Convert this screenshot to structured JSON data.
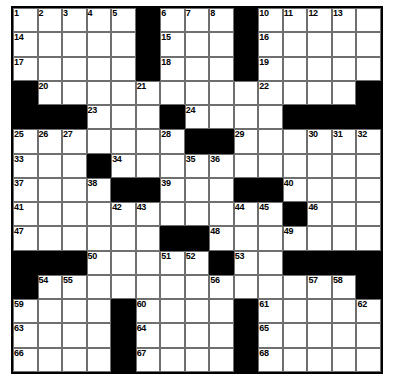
{
  "puzzle": {
    "type": "crossword-grid",
    "rows": 15,
    "cols": 15,
    "background_color": "#ffffff",
    "block_color": "#000000",
    "cell_color": "#ffffff",
    "grid_line_color": "#6f6f6f",
    "border_color": "#000000",
    "number_color": "#000000",
    "max_number": 68,
    "blocks": [
      [
        0,
        5
      ],
      [
        0,
        9
      ],
      [
        1,
        5
      ],
      [
        1,
        9
      ],
      [
        2,
        5
      ],
      [
        2,
        9
      ],
      [
        3,
        0
      ],
      [
        3,
        14
      ],
      [
        4,
        0
      ],
      [
        4,
        1
      ],
      [
        4,
        2
      ],
      [
        4,
        6
      ],
      [
        4,
        11
      ],
      [
        4,
        12
      ],
      [
        4,
        13
      ],
      [
        4,
        14
      ],
      [
        5,
        7
      ],
      [
        5,
        8
      ],
      [
        6,
        3
      ],
      [
        7,
        4
      ],
      [
        7,
        5
      ],
      [
        7,
        9
      ],
      [
        7,
        10
      ],
      [
        8,
        11
      ],
      [
        9,
        6
      ],
      [
        9,
        7
      ],
      [
        10,
        0
      ],
      [
        10,
        1
      ],
      [
        10,
        2
      ],
      [
        10,
        8
      ],
      [
        10,
        11
      ],
      [
        10,
        12
      ],
      [
        10,
        13
      ],
      [
        10,
        14
      ],
      [
        11,
        0
      ],
      [
        11,
        14
      ],
      [
        12,
        4
      ],
      [
        12,
        9
      ],
      [
        13,
        4
      ],
      [
        13,
        9
      ],
      [
        14,
        4
      ],
      [
        14,
        9
      ]
    ],
    "numbers": [
      {
        "row": 0,
        "col": 0,
        "n": 1
      },
      {
        "row": 0,
        "col": 1,
        "n": 2
      },
      {
        "row": 0,
        "col": 2,
        "n": 3
      },
      {
        "row": 0,
        "col": 3,
        "n": 4
      },
      {
        "row": 0,
        "col": 4,
        "n": 5
      },
      {
        "row": 0,
        "col": 6,
        "n": 6
      },
      {
        "row": 0,
        "col": 7,
        "n": 7
      },
      {
        "row": 0,
        "col": 8,
        "n": 8
      },
      {
        "row": 0,
        "col": 9,
        "n": 9
      },
      {
        "row": 0,
        "col": 10,
        "n": 10
      },
      {
        "row": 0,
        "col": 11,
        "n": 11
      },
      {
        "row": 0,
        "col": 12,
        "n": 12
      },
      {
        "row": 0,
        "col": 13,
        "n": 13
      },
      {
        "row": 1,
        "col": 0,
        "n": 14
      },
      {
        "row": 1,
        "col": 6,
        "n": 15
      },
      {
        "row": 1,
        "col": 10,
        "n": 16
      },
      {
        "row": 2,
        "col": 0,
        "n": 17
      },
      {
        "row": 2,
        "col": 6,
        "n": 18
      },
      {
        "row": 2,
        "col": 10,
        "n": 19
      },
      {
        "row": 3,
        "col": 1,
        "n": 20
      },
      {
        "row": 3,
        "col": 5,
        "n": 21
      },
      {
        "row": 3,
        "col": 10,
        "n": 22
      },
      {
        "row": 4,
        "col": 3,
        "n": 23
      },
      {
        "row": 4,
        "col": 7,
        "n": 24
      },
      {
        "row": 5,
        "col": 0,
        "n": 25
      },
      {
        "row": 5,
        "col": 1,
        "n": 26
      },
      {
        "row": 5,
        "col": 2,
        "n": 27
      },
      {
        "row": 5,
        "col": 6,
        "n": 28
      },
      {
        "row": 5,
        "col": 9,
        "n": 29
      },
      {
        "row": 5,
        "col": 12,
        "n": 30
      },
      {
        "row": 5,
        "col": 13,
        "n": 31
      },
      {
        "row": 5,
        "col": 14,
        "n": 32
      },
      {
        "row": 6,
        "col": 0,
        "n": 33
      },
      {
        "row": 6,
        "col": 4,
        "n": 34
      },
      {
        "row": 6,
        "col": 7,
        "n": 35
      },
      {
        "row": 6,
        "col": 8,
        "n": 36
      },
      {
        "row": 7,
        "col": 0,
        "n": 37
      },
      {
        "row": 7,
        "col": 3,
        "n": 38
      },
      {
        "row": 7,
        "col": 6,
        "n": 39
      },
      {
        "row": 7,
        "col": 11,
        "n": 40
      },
      {
        "row": 8,
        "col": 0,
        "n": 41
      },
      {
        "row": 8,
        "col": 4,
        "n": 42
      },
      {
        "row": 8,
        "col": 5,
        "n": 43
      },
      {
        "row": 8,
        "col": 9,
        "n": 44
      },
      {
        "row": 8,
        "col": 10,
        "n": 45
      },
      {
        "row": 8,
        "col": 12,
        "n": 46
      },
      {
        "row": 9,
        "col": 0,
        "n": 47
      },
      {
        "row": 9,
        "col": 8,
        "n": 48
      },
      {
        "row": 9,
        "col": 11,
        "n": 49
      },
      {
        "row": 10,
        "col": 3,
        "n": 50
      },
      {
        "row": 10,
        "col": 6,
        "n": 51
      },
      {
        "row": 10,
        "col": 7,
        "n": 52
      },
      {
        "row": 10,
        "col": 9,
        "n": 53
      },
      {
        "row": 11,
        "col": 1,
        "n": 54
      },
      {
        "row": 11,
        "col": 2,
        "n": 55
      },
      {
        "row": 11,
        "col": 8,
        "n": 56
      },
      {
        "row": 11,
        "col": 12,
        "n": 57
      },
      {
        "row": 11,
        "col": 13,
        "n": 58
      },
      {
        "row": 12,
        "col": 0,
        "n": 59
      },
      {
        "row": 12,
        "col": 5,
        "n": 60
      },
      {
        "row": 12,
        "col": 10,
        "n": 61
      },
      {
        "row": 12,
        "col": 14,
        "n": 62
      },
      {
        "row": 13,
        "col": 0,
        "n": 63
      },
      {
        "row": 13,
        "col": 5,
        "n": 64
      },
      {
        "row": 13,
        "col": 10,
        "n": 65
      },
      {
        "row": 14,
        "col": 0,
        "n": 66
      },
      {
        "row": 14,
        "col": 5,
        "n": 67
      },
      {
        "row": 14,
        "col": 10,
        "n": 68
      }
    ],
    "letters": []
  }
}
